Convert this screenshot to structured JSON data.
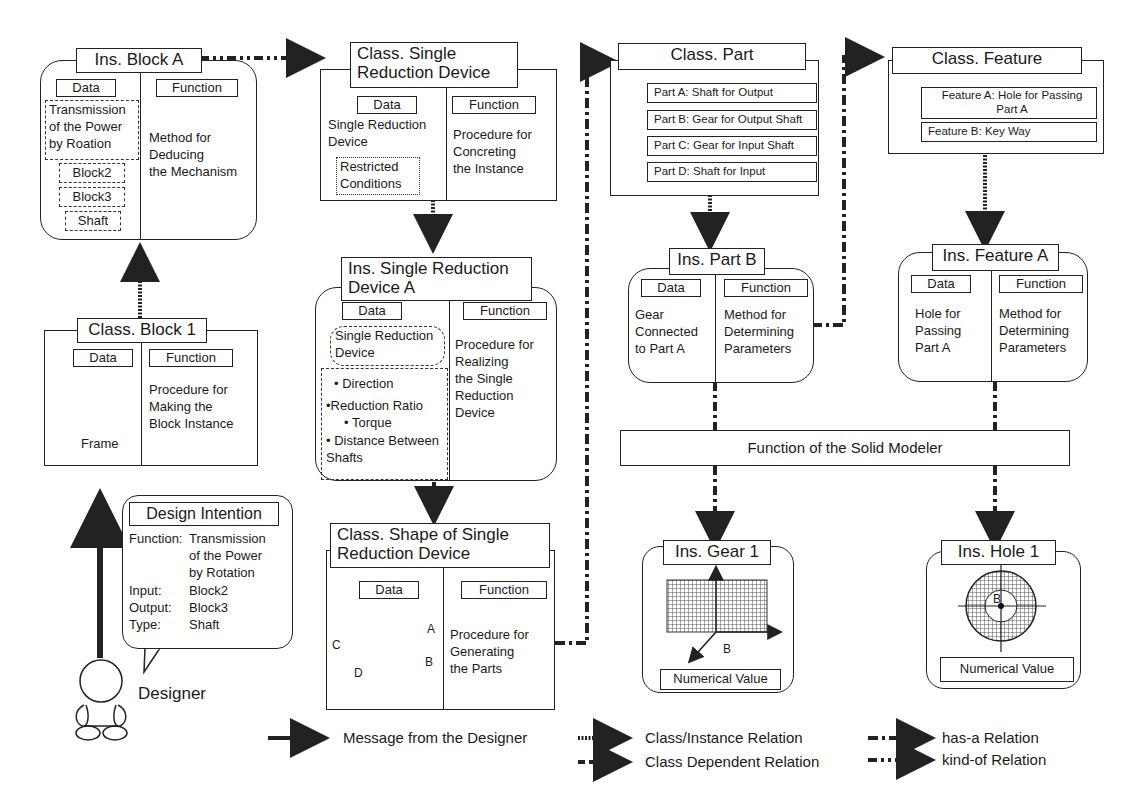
{
  "labels": {
    "data": "Data",
    "function": "Function"
  },
  "ins_block_a": {
    "title": "Ins. Block A",
    "data_items": [
      "Transmission\nof the Power\nby Roation",
      "Block2",
      "Block3",
      "Shaft"
    ],
    "function_text": "Method for\nDeducing\nthe Mechanism"
  },
  "class_block_1": {
    "title": "Class. Block 1",
    "data_caption": "Frame",
    "function_text": "Procedure for\nMaking the\nBlock Instance"
  },
  "design_intention": {
    "title": "Design Intention",
    "rows": [
      {
        "key": "Function:",
        "value": "Transmission\nof the Power\nby Rotation"
      },
      {
        "key": "Input:",
        "value": "Block2"
      },
      {
        "key": "Output:",
        "value": "Block3"
      },
      {
        "key": "Type:",
        "value": "Shaft"
      }
    ]
  },
  "designer": {
    "label": "Designer"
  },
  "class_srd": {
    "title": "Class. Single\nReduction Device",
    "data_text": "Single Reduction\nDevice",
    "data_sub": "Restricted\nConditions",
    "function_text": "Procedure for\nConcreting\nthe Instance"
  },
  "ins_srd_a": {
    "title": "Ins. Single\nReduction Device A",
    "data_text": "Single Reduction\nDevice",
    "params": [
      "• Direction",
      "•Reduction Ratio",
      "• Torque",
      "• Distance Between\nShafts"
    ],
    "function_text": "Procedure for\nRealizing\nthe Single\nReduction\nDevice"
  },
  "class_shape": {
    "title": "Class. Shape of Single\nReduction Device",
    "shape_labels": {
      "a": "A",
      "b": "B",
      "c": "C",
      "d": "D"
    },
    "function_text": "Procedure for\nGenerating\nthe Parts"
  },
  "class_part": {
    "title": "Class. Part",
    "items": [
      "Part A: Shaft for Output",
      "Part B: Gear for Output Shaft",
      "Part C:  Gear for Input  Shaft",
      "Part D: Shaft for Input"
    ]
  },
  "class_feature": {
    "title": "Class. Feature",
    "items": [
      "Feature A: Hole for Passing\nPart A",
      "Feature B: Key Way"
    ]
  },
  "ins_part_b": {
    "title": "Ins. Part B",
    "data_text": "Gear\nConnected\nto Part A",
    "function_text": "Method for\nDetermining\nParameters"
  },
  "ins_feature_a": {
    "title": "Ins. Feature A",
    "data_text": "Hole for\nPassing\nPart A",
    "function_text": "Method for\nDetermining\nParameters"
  },
  "solid_modeler": {
    "label": "Function of the Solid Modeler"
  },
  "ins_gear_1": {
    "title": "Ins. Gear 1",
    "axis_label": "B",
    "value_label": "Numerical Value"
  },
  "ins_hole_1": {
    "title": "Ins. Hole 1",
    "axis_label": "B",
    "value_label": "Numerical Value"
  },
  "legend": [
    {
      "style": "solid",
      "label": "Message from the Designer"
    },
    {
      "style": "dotted",
      "label": "Class/Instance Relation"
    },
    {
      "style": "dashed",
      "label": "Class Dependent Relation"
    },
    {
      "style": "dash-dot",
      "label": "has-a Relation"
    },
    {
      "style": "dash-dot-dot",
      "label": "kind-of Relation"
    }
  ],
  "colors": {
    "ink": "#222222",
    "background": "#ffffff",
    "hatch": "#555555"
  }
}
